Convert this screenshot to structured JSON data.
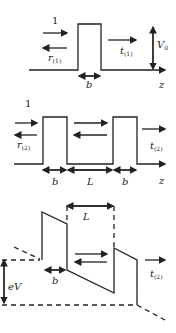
{
  "panels": [
    {
      "id": "single-barrier",
      "labels": {
        "incident": "1",
        "reflected": "r",
        "reflected_sub": "(1)",
        "transmitted": "t",
        "transmitted_sub": "(1)",
        "height": "V",
        "height_sub": "0",
        "width": "b",
        "axis": "z"
      }
    },
    {
      "id": "double-barrier",
      "labels": {
        "incident": "1",
        "reflected": "r",
        "reflected_sub": "(2)",
        "transmitted": "t",
        "transmitted_sub": "(2)",
        "width1": "b",
        "separation": "L",
        "width2": "b",
        "axis": "z"
      }
    },
    {
      "id": "biased-double-barrier",
      "labels": {
        "separation": "L",
        "width": "b",
        "bias": "eV",
        "transmitted": "t",
        "transmitted_sub": "(2)"
      }
    }
  ]
}
